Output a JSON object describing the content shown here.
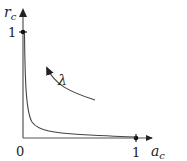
{
  "diagram": {
    "y_axis": {
      "label_main": "r",
      "label_sub": "c",
      "tick_label": "1"
    },
    "x_axis": {
      "label_main": "a",
      "label_sub": "c",
      "tick_label": "1"
    },
    "origin_label": "0",
    "parameter_label": "λ",
    "colors": {
      "stroke": "#333333",
      "text": "#222222",
      "background": "#ffffff"
    }
  }
}
